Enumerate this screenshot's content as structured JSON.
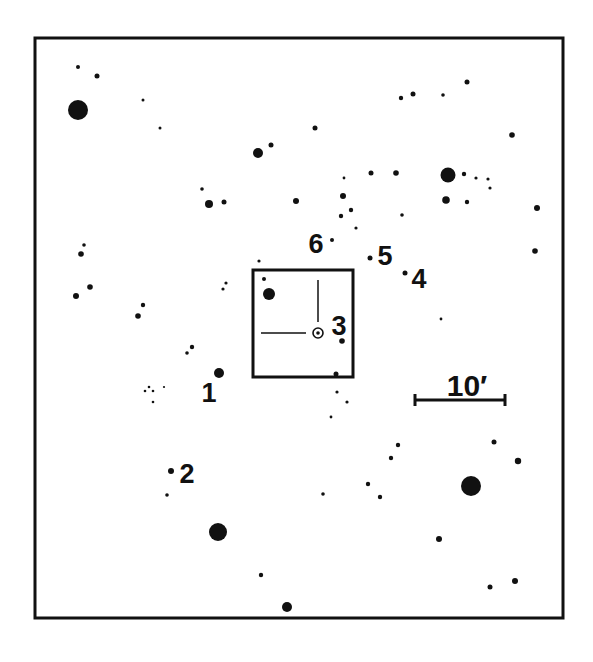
{
  "colors": {
    "ink": "#111111",
    "background": "#ffffff"
  },
  "frame": {
    "x": 35,
    "y": 38,
    "width": 528,
    "height": 580,
    "stroke": 3
  },
  "field_box": {
    "x": 253,
    "y": 270,
    "width": 100,
    "height": 107,
    "stroke": 3
  },
  "target": {
    "label": "3",
    "x": 318,
    "y": 333,
    "ring_radius": 5,
    "dot_radius": 1.8,
    "crosshair_vertical": {
      "x": 318,
      "y1": 280,
      "y2": 322
    },
    "crosshair_horizontal": {
      "y": 333,
      "x1": 261,
      "x2": 306
    }
  },
  "scale_bar": {
    "label": "10′",
    "x1": 415,
    "x2": 505,
    "y": 400,
    "tick_half": 6,
    "label_x": 467,
    "label_y": 396
  },
  "labels": [
    {
      "text": "1",
      "x": 209,
      "y": 402,
      "size": 27
    },
    {
      "text": "2",
      "x": 187,
      "y": 483,
      "size": 27
    },
    {
      "text": "3",
      "x": 339,
      "y": 335,
      "size": 27
    },
    {
      "text": "4",
      "x": 419,
      "y": 288,
      "size": 27
    },
    {
      "text": "5",
      "x": 385,
      "y": 265,
      "size": 27
    },
    {
      "text": "6",
      "x": 316,
      "y": 253,
      "size": 27
    }
  ],
  "stars": [
    {
      "x": 78,
      "y": 67,
      "r": 2
    },
    {
      "x": 97,
      "y": 76,
      "r": 2.5
    },
    {
      "x": 78,
      "y": 110,
      "r": 10
    },
    {
      "x": 143,
      "y": 100,
      "r": 1.5
    },
    {
      "x": 160,
      "y": 128,
      "r": 1.5
    },
    {
      "x": 315,
      "y": 128,
      "r": 2.5
    },
    {
      "x": 271,
      "y": 145,
      "r": 2.5
    },
    {
      "x": 258,
      "y": 153,
      "r": 5
    },
    {
      "x": 202,
      "y": 189,
      "r": 1.8
    },
    {
      "x": 209,
      "y": 204,
      "r": 4
    },
    {
      "x": 224,
      "y": 202,
      "r": 2.5
    },
    {
      "x": 296,
      "y": 201,
      "r": 3
    },
    {
      "x": 344,
      "y": 178,
      "r": 1.4
    },
    {
      "x": 371,
      "y": 173,
      "r": 2.5
    },
    {
      "x": 343,
      "y": 196,
      "r": 3
    },
    {
      "x": 351,
      "y": 210,
      "r": 2.2
    },
    {
      "x": 341,
      "y": 216,
      "r": 2.2
    },
    {
      "x": 356,
      "y": 228,
      "r": 1.6
    },
    {
      "x": 401,
      "y": 98,
      "r": 2.2
    },
    {
      "x": 413,
      "y": 94,
      "r": 2.5
    },
    {
      "x": 443,
      "y": 95,
      "r": 1.8
    },
    {
      "x": 467,
      "y": 82,
      "r": 2.5
    },
    {
      "x": 512,
      "y": 135,
      "r": 2.8
    },
    {
      "x": 396,
      "y": 173,
      "r": 2.8
    },
    {
      "x": 448,
      "y": 175,
      "r": 7.5
    },
    {
      "x": 464,
      "y": 174,
      "r": 2.2
    },
    {
      "x": 476,
      "y": 178,
      "r": 1.6
    },
    {
      "x": 488,
      "y": 179,
      "r": 1.6
    },
    {
      "x": 490,
      "y": 188,
      "r": 1.6
    },
    {
      "x": 446,
      "y": 200,
      "r": 3.8
    },
    {
      "x": 467,
      "y": 202,
      "r": 2.2
    },
    {
      "x": 537,
      "y": 208,
      "r": 3
    },
    {
      "x": 402,
      "y": 215,
      "r": 1.8
    },
    {
      "x": 535,
      "y": 251,
      "r": 2.8
    },
    {
      "x": 84,
      "y": 245,
      "r": 1.8
    },
    {
      "x": 81,
      "y": 254,
      "r": 2.8
    },
    {
      "x": 90,
      "y": 287,
      "r": 2.8
    },
    {
      "x": 76,
      "y": 296,
      "r": 3
    },
    {
      "x": 143,
      "y": 305,
      "r": 2.2
    },
    {
      "x": 138,
      "y": 316,
      "r": 2.8
    },
    {
      "x": 226,
      "y": 283,
      "r": 1.6
    },
    {
      "x": 223,
      "y": 289,
      "r": 1.6
    },
    {
      "x": 192,
      "y": 347,
      "r": 2.2
    },
    {
      "x": 187,
      "y": 353,
      "r": 1.8
    },
    {
      "x": 219,
      "y": 373,
      "r": 5
    },
    {
      "x": 145,
      "y": 391,
      "r": 1.3
    },
    {
      "x": 149,
      "y": 387,
      "r": 1.3
    },
    {
      "x": 153,
      "y": 391,
      "r": 1.3
    },
    {
      "x": 164,
      "y": 387,
      "r": 1.1
    },
    {
      "x": 153,
      "y": 402,
      "r": 1.3
    },
    {
      "x": 259,
      "y": 261,
      "r": 1.6
    },
    {
      "x": 264,
      "y": 279,
      "r": 2
    },
    {
      "x": 269,
      "y": 294,
      "r": 6
    },
    {
      "x": 332,
      "y": 240,
      "r": 2
    },
    {
      "x": 370,
      "y": 258,
      "r": 2.5
    },
    {
      "x": 405,
      "y": 273,
      "r": 2.5
    },
    {
      "x": 342,
      "y": 341,
      "r": 2.8
    },
    {
      "x": 336,
      "y": 374,
      "r": 2.5
    },
    {
      "x": 337,
      "y": 392,
      "r": 1.6
    },
    {
      "x": 347,
      "y": 402,
      "r": 1.6
    },
    {
      "x": 331,
      "y": 417,
      "r": 1.4
    },
    {
      "x": 441,
      "y": 319,
      "r": 1.4
    },
    {
      "x": 171,
      "y": 471,
      "r": 3
    },
    {
      "x": 167,
      "y": 495,
      "r": 1.8
    },
    {
      "x": 218,
      "y": 532,
      "r": 9
    },
    {
      "x": 261,
      "y": 575,
      "r": 2.2
    },
    {
      "x": 287,
      "y": 607,
      "r": 5
    },
    {
      "x": 398,
      "y": 445,
      "r": 2.2
    },
    {
      "x": 391,
      "y": 458,
      "r": 2.2
    },
    {
      "x": 368,
      "y": 484,
      "r": 2.2
    },
    {
      "x": 323,
      "y": 494,
      "r": 1.8
    },
    {
      "x": 380,
      "y": 497,
      "r": 2.2
    },
    {
      "x": 494,
      "y": 442,
      "r": 2.5
    },
    {
      "x": 518,
      "y": 461,
      "r": 3.2
    },
    {
      "x": 471,
      "y": 486,
      "r": 10
    },
    {
      "x": 439,
      "y": 539,
      "r": 3
    },
    {
      "x": 515,
      "y": 581,
      "r": 3
    },
    {
      "x": 490,
      "y": 587,
      "r": 2.5
    }
  ]
}
